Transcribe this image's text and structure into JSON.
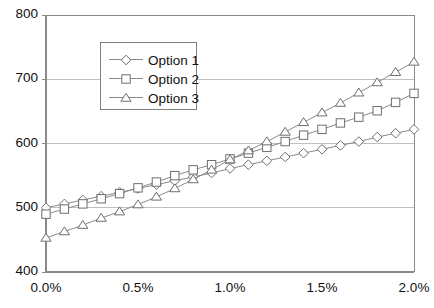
{
  "chart_data": {
    "type": "line",
    "title": "",
    "subtitle": "",
    "xlabel": "",
    "ylabel": "",
    "xlim": [
      0.0,
      2.0
    ],
    "ylim": [
      400,
      800
    ],
    "grid": "horizontal",
    "legend_position": "upper-center",
    "x_tick_labels": [
      "0.0%",
      "0.5%",
      "1.0%",
      "1.5%",
      "2.0%"
    ],
    "x_tick_values": [
      0.0,
      0.5,
      1.0,
      1.5,
      2.0
    ],
    "y_tick_labels": [
      "400",
      "500",
      "600",
      "700",
      "800"
    ],
    "y_tick_values": [
      400,
      500,
      600,
      700,
      800
    ],
    "x": [
      0.0,
      0.1,
      0.2,
      0.3,
      0.4,
      0.5,
      0.6,
      0.7,
      0.8,
      0.9,
      1.0,
      1.1,
      1.2,
      1.3,
      1.4,
      1.5,
      1.6,
      1.7,
      1.8,
      1.9,
      2.0
    ],
    "series": [
      {
        "name": "Option 1",
        "marker": "diamond",
        "values": [
          500,
          506,
          512,
          518,
          524,
          530,
          536,
          542,
          548,
          554,
          561,
          567,
          573,
          579,
          585,
          591,
          597,
          603,
          610,
          616,
          622
        ]
      },
      {
        "name": "Option 2",
        "marker": "square",
        "values": [
          490,
          498,
          506,
          514,
          522,
          531,
          540,
          550,
          559,
          567,
          576,
          585,
          594,
          603,
          613,
          622,
          632,
          641,
          651,
          664,
          678
        ]
      },
      {
        "name": "Option 3",
        "marker": "triangle",
        "values": [
          453,
          463,
          473,
          484,
          494,
          505,
          517,
          530,
          544,
          559,
          575,
          589,
          603,
          618,
          633,
          648,
          663,
          679,
          695,
          711,
          727
        ]
      }
    ]
  },
  "legend": {
    "items": [
      {
        "label": "Option 1"
      },
      {
        "label": "Option 2"
      },
      {
        "label": "Option 3"
      }
    ]
  },
  "axes": {
    "plot_left": 46,
    "plot_right": 414,
    "plot_top": 15,
    "plot_bottom": 272
  },
  "colors": {
    "line": "#8a8a8a",
    "marker_stroke": "#6e6e6e",
    "marker_fill": "#ffffff",
    "grid": "#bfbfbf",
    "axis": "#8a8a8a",
    "text": "#111111",
    "plot_background": "#ffffff"
  }
}
